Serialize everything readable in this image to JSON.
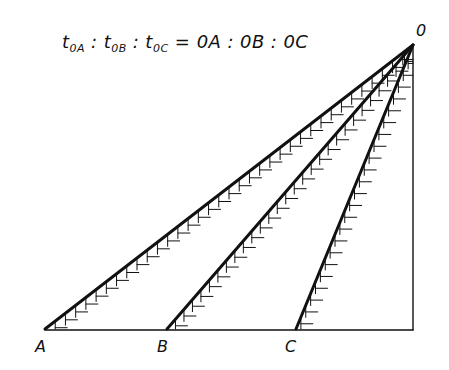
{
  "formula": {
    "lhs": [
      {
        "base": "t",
        "sub": "0A"
      },
      {
        "base": "t",
        "sub": "0B"
      },
      {
        "base": "t",
        "sub": "0C"
      }
    ],
    "separator": ":",
    "equals": "=",
    "rhs": [
      "0A",
      "0B",
      "0C"
    ]
  },
  "points": {
    "O": {
      "label": "0",
      "x": 413,
      "y": 45
    },
    "A": {
      "label": "A",
      "x": 45,
      "y": 329
    },
    "B": {
      "label": "B",
      "x": 167,
      "y": 329
    },
    "C": {
      "label": "C",
      "x": 296,
      "y": 329
    },
    "foot": {
      "x": 413,
      "y": 329
    }
  },
  "lines": [
    {
      "name": "OA",
      "from": "O",
      "to": "A"
    },
    {
      "name": "OB",
      "from": "O",
      "to": "B"
    },
    {
      "name": "OC",
      "from": "O",
      "to": "C"
    }
  ],
  "style": {
    "stroke": "#111111",
    "hatch_spacing": 11,
    "hatch_length": 12
  }
}
